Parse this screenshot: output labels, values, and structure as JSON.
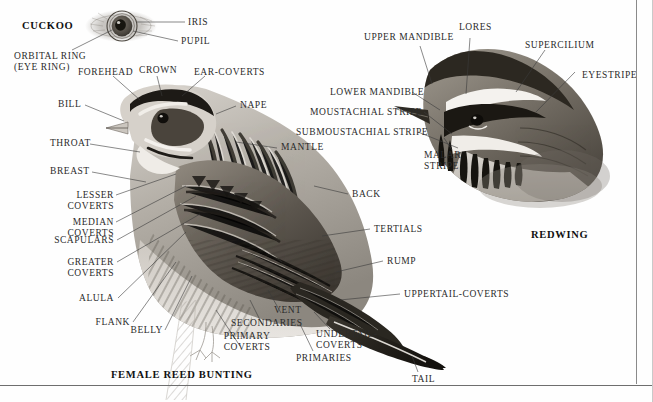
{
  "page": {
    "background": "#fefefe",
    "ink": "#2b2b2b"
  },
  "eye_diagram": {
    "caption": "CUCKOO",
    "labels": [
      {
        "id": "iris",
        "text": "IRIS"
      },
      {
        "id": "pupil",
        "text": "PUPIL"
      },
      {
        "id": "orbital-ring",
        "text": "ORBITAL RING\n(EYE RING)"
      }
    ]
  },
  "bunting": {
    "caption": "FEMALE REED BUNTING",
    "labels": [
      {
        "id": "forehead",
        "text": "FOREHEAD"
      },
      {
        "id": "crown",
        "text": "CROWN"
      },
      {
        "id": "ear-coverts",
        "text": "EAR-COVERTS"
      },
      {
        "id": "nape",
        "text": "NAPE"
      },
      {
        "id": "bill",
        "text": "BILL"
      },
      {
        "id": "throat",
        "text": "THROAT"
      },
      {
        "id": "breast",
        "text": "BREAST"
      },
      {
        "id": "mantle",
        "text": "MANTLE"
      },
      {
        "id": "lesser-coverts",
        "text": "LESSER\nCOVERTS"
      },
      {
        "id": "median-coverts",
        "text": "MEDIAN\nCOVERTS"
      },
      {
        "id": "scapulars",
        "text": "SCAPULARS"
      },
      {
        "id": "greater-coverts",
        "text": "GREATER\nCOVERTS"
      },
      {
        "id": "alula",
        "text": "ALULA"
      },
      {
        "id": "flank",
        "text": "FLANK"
      },
      {
        "id": "belly",
        "text": "BELLY"
      },
      {
        "id": "primary-coverts",
        "text": "PRIMARY\nCOVERTS"
      },
      {
        "id": "secondaries",
        "text": "SECONDARIES"
      },
      {
        "id": "vent",
        "text": "VENT"
      },
      {
        "id": "primaries",
        "text": "PRIMARIES"
      },
      {
        "id": "undertail-coverts",
        "text": "UNDERTAIL-\nCOVERTS"
      },
      {
        "id": "back",
        "text": "BACK"
      },
      {
        "id": "tertials",
        "text": "TERTIALS"
      },
      {
        "id": "rump",
        "text": "RUMP"
      },
      {
        "id": "uppertail-coverts",
        "text": "UPPERTAIL-COVERTS"
      },
      {
        "id": "tail",
        "text": "TAIL"
      }
    ]
  },
  "redwing": {
    "caption": "REDWING",
    "labels": [
      {
        "id": "upper-mandible",
        "text": "UPPER MANDIBLE"
      },
      {
        "id": "lores",
        "text": "LORES"
      },
      {
        "id": "supercilium",
        "text": "SUPERCILIUM"
      },
      {
        "id": "eyestripe",
        "text": "EYESTRIPE"
      },
      {
        "id": "lower-mandible",
        "text": "LOWER MANDIBLE"
      },
      {
        "id": "moustachial-stripe",
        "text": "MOUSTACHIAL STRIPE"
      },
      {
        "id": "submoustachial-stripe",
        "text": "SUBMOUSTACHIAL STRIPE"
      },
      {
        "id": "malar-stripe",
        "text": "MALAR\nSTRIPE"
      }
    ]
  }
}
